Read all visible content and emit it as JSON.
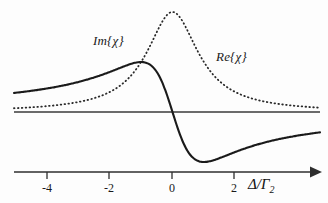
{
  "chart_data": {
    "type": "line",
    "title": "",
    "xlabel": "Δ/Γ₂",
    "ylabel": "",
    "xlim": [
      -5.05,
      4.7
    ],
    "ylim": [
      -1.25,
      1.9
    ],
    "grid": false,
    "legend_position": "inline-annotation",
    "axis_style": "single horizontal axis with arrow at right, ticks below",
    "xticks": [
      -4,
      -2,
      0,
      2
    ],
    "xtick_labels": [
      "-4",
      "-2",
      "0",
      "2"
    ],
    "zero_line": true,
    "series": [
      {
        "name": "Im{χ}",
        "label": "Im{χ}",
        "style": "dotted",
        "color": "#2a2a2a",
        "formula": "1 / (1 + x^2)",
        "peak_x": 0,
        "peak_y": 1.0,
        "half_width": 1,
        "x": [
          -5.05,
          -4.5,
          -4,
          -3.5,
          -3,
          -2.5,
          -2,
          -1.75,
          -1.5,
          -1.25,
          -1,
          -0.75,
          -0.5,
          -0.25,
          0,
          0.25,
          0.5,
          0.75,
          1,
          1.25,
          1.5,
          1.75,
          2,
          2.5,
          3,
          3.5,
          4,
          4.7
        ],
        "values": [
          0.038,
          0.047,
          0.059,
          0.075,
          0.1,
          0.138,
          0.2,
          0.246,
          0.308,
          0.39,
          0.5,
          0.64,
          0.8,
          0.941,
          1.0,
          0.941,
          0.8,
          0.64,
          0.5,
          0.39,
          0.308,
          0.246,
          0.2,
          0.138,
          0.1,
          0.075,
          0.059,
          0.043
        ]
      },
      {
        "name": "Re{χ}",
        "label": "Re{χ}",
        "style": "solid",
        "color": "#1a1a1a",
        "formula": "-x / (1 + x^2)",
        "max_x": 1.0,
        "max_y": 0.5,
        "min_x": -1.0,
        "min_y": -0.5,
        "zero_crossing_x": 0,
        "x": [
          -5.05,
          -4.5,
          -4,
          -3.5,
          -3,
          -2.5,
          -2,
          -1.75,
          -1.5,
          -1.25,
          -1,
          -0.75,
          -0.5,
          -0.25,
          0,
          0.25,
          0.5,
          0.75,
          1,
          1.25,
          1.5,
          1.75,
          2,
          2.5,
          3,
          3.5,
          4,
          4.7
        ],
        "values": [
          -0.192,
          -0.212,
          -0.235,
          -0.263,
          -0.3,
          -0.345,
          -0.4,
          -0.431,
          -0.462,
          -0.488,
          -0.5,
          -0.48,
          -0.4,
          -0.235,
          0.0,
          0.235,
          0.4,
          0.48,
          0.5,
          0.488,
          0.462,
          0.431,
          0.4,
          0.345,
          0.3,
          0.263,
          0.235,
          0.203
        ]
      }
    ],
    "annotations": [
      {
        "text": "Im{χ}",
        "x": -2.45,
        "y": 1.35,
        "name": "im-chi-label"
      },
      {
        "text": "Re{χ}",
        "x": 1.45,
        "y": 1.02,
        "name": "re-chi-label"
      }
    ]
  },
  "axis": {
    "x_title_main": "Δ/Γ",
    "x_title_sub": "2",
    "ticks": [
      {
        "label": "-4",
        "value": -4,
        "px": 47
      },
      {
        "label": "-2",
        "value": -2,
        "px": 109
      },
      {
        "label": "0",
        "value": 0,
        "px": 172
      },
      {
        "label": "2",
        "value": 2,
        "px": 234
      }
    ]
  },
  "colors": {
    "background": "#fdfdfd",
    "curve": "#1a1a1a",
    "axis": "#333333",
    "text": "#1a1a1a"
  }
}
